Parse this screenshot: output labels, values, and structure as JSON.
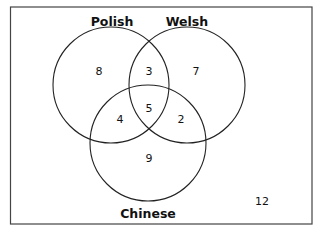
{
  "diagram": {
    "type": "venn",
    "sets": [
      {
        "id": "polish",
        "label": "Polish"
      },
      {
        "id": "welsh",
        "label": "Welsh"
      },
      {
        "id": "chinese",
        "label": "Chinese"
      }
    ],
    "regions": {
      "polish_only": "8",
      "welsh_only": "7",
      "chinese_only": "9",
      "polish_welsh": "3",
      "polish_chinese": "4",
      "welsh_chinese": "2",
      "all_three": "5",
      "outside": "12"
    },
    "colors": {
      "stroke": "#222222",
      "background": "#ffffff"
    }
  }
}
